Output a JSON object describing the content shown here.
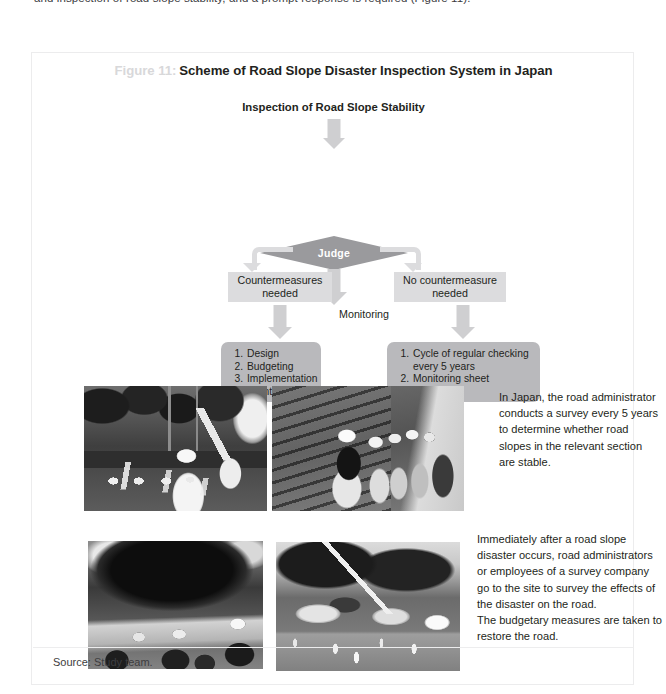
{
  "page": {
    "top_cut_text": "and inspection of road slope stability, and a prompt response is required (Figure 11)."
  },
  "figure": {
    "number_label": "Figure 11:",
    "title": "Scheme of Road Slope Disaster Inspection System in Japan",
    "source": "Source: Study team."
  },
  "flowchart": {
    "header": "Inspection of Road Slope Stability",
    "decision": "Judge",
    "branch_left": "Countermeasures\nneeded",
    "branch_left_line1": "Countermeasures",
    "branch_left_line2": "needed",
    "branch_right_line1": "No countermeasure",
    "branch_right_line2": "needed",
    "center_label": "Monitoring",
    "left_list": [
      "Design",
      "Budgeting",
      "Implementation",
      "Maintenance"
    ],
    "right_list": [
      "Cycle of regular checking every 5 years",
      "Monitoring sheet employed"
    ]
  },
  "photos": [
    {
      "id": "photo-road-inspection-worker",
      "alt": "Worker in white protective suit and hard hat standing on a road beside a wooded slope"
    },
    {
      "id": "photo-group-inspecting-retaining-wall",
      "alt": "Group of workers wearing hard hats inspecting a stone retaining wall along a road"
    },
    {
      "id": "photo-onlookers-at-collapsed-slope",
      "alt": "People in hard hats observing a collapsed dark rock slope"
    },
    {
      "id": "photo-road-clearing-after-rockfall",
      "alt": "Road with fallen rock, a crane boom, traffic cones and a white van during disaster response"
    }
  ],
  "descriptions": {
    "top": "In Japan, the road administrator conducts a survey every 5 years to determine whether road slopes in the relevant section are stable.",
    "bottom": "Immediately after a road slope disaster occurs, road administrators or employees of a survey company go to the site to survey the effects of the disaster on the road.\nThe budgetary measures are taken to restore the road."
  },
  "colors": {
    "decision_fill": "#9a9a9d",
    "process_fill": "#dcdcde",
    "list_fill": "#b9b9bc",
    "arrow_fill": "#cfcfd1",
    "figure_number": "#d8d8da",
    "text": "#231f20",
    "frame": "#ececed"
  }
}
